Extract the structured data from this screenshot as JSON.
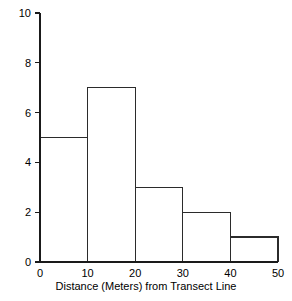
{
  "chart_data": {
    "type": "bar",
    "title": "",
    "subtitle": "",
    "xlabel": "Distance (Meters) from Transect Line",
    "ylabel": "Number of Detections",
    "categories": [
      "0-10",
      "10-20",
      "20-30",
      "30-40",
      "40-50"
    ],
    "bin_edges": [
      0,
      10,
      20,
      30,
      40,
      50
    ],
    "values": [
      5,
      7,
      3,
      2,
      1
    ],
    "xlim": [
      0,
      50
    ],
    "ylim": [
      0,
      10
    ],
    "xticks": [
      0,
      10,
      20,
      30,
      40,
      50
    ],
    "yticks": [
      0,
      2,
      4,
      6,
      8,
      10
    ],
    "xticklabels": [
      "0",
      "10",
      "20",
      "30",
      "40",
      "50"
    ],
    "yticklabels": [
      "0",
      "2",
      "4",
      "6",
      "8",
      "10"
    ],
    "grid": false,
    "legend": null,
    "legend_position": "none",
    "bar_fill": "none",
    "bar_edge_color": "#2b2b2b",
    "axis_color": "#1a1a1a",
    "background_color": "#ffffff",
    "annotations": []
  },
  "axes": {
    "x_title": "Distance (Meters) from Transect Line",
    "y_title": "Number of Detections"
  }
}
